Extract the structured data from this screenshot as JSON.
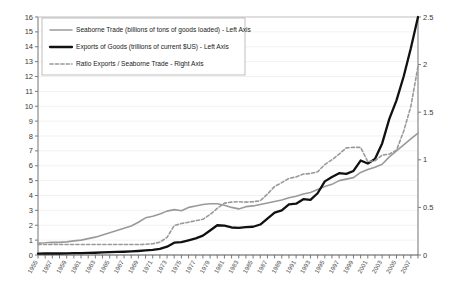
{
  "chart_data": {
    "type": "line",
    "title": "",
    "xlabel": "",
    "ylabel": "",
    "grid": true,
    "legend_position": "top-left",
    "left_axis": {
      "label": "Left Axis",
      "min": 0,
      "max": 16,
      "step": 1,
      "ticks": [
        "0",
        "1",
        "2",
        "3",
        "4",
        "5",
        "6",
        "7",
        "8",
        "9",
        "10",
        "11",
        "12",
        "13",
        "14",
        "15",
        "16"
      ]
    },
    "right_axis": {
      "label": "Right Axis",
      "min": 0,
      "max": 2.5,
      "step": 0.5,
      "ticks": [
        "0",
        "0.5",
        "1",
        "1.5",
        "2",
        "2.5"
      ]
    },
    "x": [
      1955,
      1956,
      1957,
      1958,
      1959,
      1960,
      1961,
      1962,
      1963,
      1964,
      1965,
      1966,
      1967,
      1968,
      1969,
      1970,
      1971,
      1972,
      1973,
      1974,
      1975,
      1976,
      1977,
      1978,
      1979,
      1980,
      1981,
      1982,
      1983,
      1984,
      1985,
      1986,
      1987,
      1988,
      1989,
      1990,
      1991,
      1992,
      1993,
      1994,
      1995,
      1996,
      1997,
      1998,
      1999,
      2000,
      2001,
      2002,
      2003,
      2004,
      2005,
      2006,
      2007,
      2008
    ],
    "xtick_labels": [
      "1955",
      "1957",
      "1959",
      "1961",
      "1963",
      "1965",
      "1967",
      "1969",
      "1971",
      "1973",
      "1975",
      "1977",
      "1979",
      "1981",
      "1983",
      "1985",
      "1987",
      "1989",
      "1991",
      "1993",
      "1995",
      "1997",
      "1999",
      "2001",
      "2003",
      "2005",
      "2007"
    ],
    "series": [
      {
        "name": "Seaborne Trade (billions of tons of goods loaded) - Left Axis",
        "axis": "left",
        "style": "solid",
        "color": "#9a9a9a",
        "width": 1.6,
        "values": [
          0.8,
          0.82,
          0.86,
          0.85,
          0.88,
          0.95,
          1.0,
          1.1,
          1.2,
          1.35,
          1.5,
          1.65,
          1.8,
          1.95,
          2.2,
          2.5,
          2.6,
          2.75,
          2.95,
          3.05,
          2.98,
          3.2,
          3.3,
          3.4,
          3.45,
          3.45,
          3.35,
          3.2,
          3.1,
          3.25,
          3.3,
          3.4,
          3.5,
          3.6,
          3.7,
          3.85,
          3.95,
          4.1,
          4.2,
          4.4,
          4.6,
          4.75,
          5.0,
          5.1,
          5.2,
          5.55,
          5.75,
          5.9,
          6.1,
          6.6,
          7.0,
          7.4,
          7.8,
          8.2
        ]
      },
      {
        "name": "Exports of Goods (trillions of current $US) - Left Axis",
        "axis": "left",
        "style": "solid",
        "color": "#111111",
        "width": 2.3,
        "values": [
          0.09,
          0.1,
          0.11,
          0.1,
          0.11,
          0.12,
          0.13,
          0.14,
          0.15,
          0.17,
          0.19,
          0.21,
          0.22,
          0.24,
          0.27,
          0.31,
          0.34,
          0.41,
          0.56,
          0.83,
          0.87,
          0.99,
          1.12,
          1.3,
          1.65,
          2.0,
          1.97,
          1.85,
          1.82,
          1.88,
          1.9,
          2.05,
          2.45,
          2.85,
          3.0,
          3.4,
          3.45,
          3.75,
          3.7,
          4.15,
          4.95,
          5.25,
          5.5,
          5.45,
          5.65,
          6.35,
          6.15,
          6.45,
          7.5,
          9.15,
          10.4,
          12.0,
          13.9,
          16.0
        ]
      },
      {
        "name": "Ratio Exports / Seaborne Trade - Right Axis",
        "axis": "right",
        "style": "dashed",
        "color": "#9a9a9a",
        "width": 1.6,
        "values": [
          0.112,
          0.11,
          0.112,
          0.11,
          0.11,
          0.11,
          0.11,
          0.11,
          0.11,
          0.11,
          0.11,
          0.11,
          0.11,
          0.11,
          0.11,
          0.112,
          0.118,
          0.135,
          0.185,
          0.31,
          0.33,
          0.345,
          0.36,
          0.375,
          0.425,
          0.49,
          0.545,
          0.555,
          0.56,
          0.555,
          0.56,
          0.57,
          0.64,
          0.72,
          0.76,
          0.805,
          0.82,
          0.85,
          0.855,
          0.875,
          0.95,
          1.0,
          1.06,
          1.125,
          1.13,
          1.13,
          0.98,
          0.99,
          1.05,
          1.06,
          1.1,
          1.3,
          1.56,
          1.98
        ]
      }
    ]
  },
  "legend": {
    "items": [
      {
        "label": "Seaborne Trade (billions of tons of goods loaded) - Left Axis"
      },
      {
        "label": "Exports of Goods (trillions of current $US) - Left Axis"
      },
      {
        "label": "Ratio Exports / Seaborne Trade - Right Axis"
      }
    ]
  }
}
